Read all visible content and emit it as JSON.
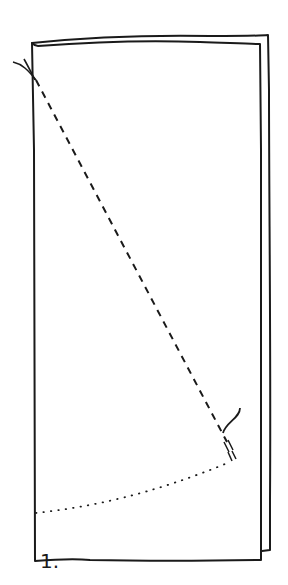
{
  "diagram": {
    "type": "folding-instruction",
    "step_label": "1.",
    "elements": [
      {
        "name": "back-sheet",
        "description": "paper sheet behind, offset right/up"
      },
      {
        "name": "front-sheet",
        "description": "front rectangular sheet"
      },
      {
        "name": "dashed-fold-line",
        "description": "diagonal dashed fold line from top-left to lower-right"
      },
      {
        "name": "dotted-arc",
        "description": "dotted arc from left edge curving up to lower-right end of fold line"
      }
    ],
    "colors": {
      "stroke": "#1a1a1a",
      "background": "#ffffff"
    }
  }
}
